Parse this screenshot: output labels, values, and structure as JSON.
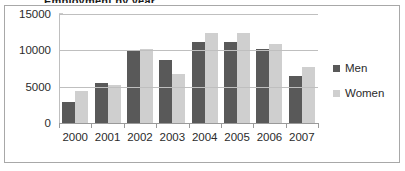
{
  "title_sliver": "Employment by year",
  "chart_data": {
    "type": "bar",
    "title": "",
    "xlabel": "",
    "ylabel": "",
    "categories": [
      "2000",
      "2001",
      "2002",
      "2003",
      "2004",
      "2005",
      "2006",
      "2007"
    ],
    "series": [
      {
        "name": "Men",
        "color": "#595959",
        "values": [
          2950,
          5500,
          9850,
          8700,
          11200,
          11150,
          10200,
          6450
        ]
      },
      {
        "name": "Women",
        "color": "#cfcfcf",
        "values": [
          4400,
          5300,
          10150,
          6750,
          12350,
          12400,
          10850,
          7650
        ]
      }
    ],
    "ylim": [
      0,
      15000
    ],
    "yticks": [
      0,
      5000,
      10000,
      15000
    ],
    "ytick_labels": [
      "0",
      "5000",
      "10000",
      "15000"
    ],
    "grid": true,
    "legend_position": "right"
  }
}
